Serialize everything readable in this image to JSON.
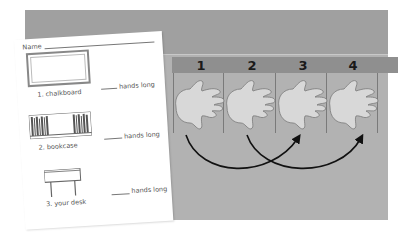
{
  "board": {
    "background_color": "#a3a3a3",
    "strip_header_color": "#8f8f8f",
    "numbers": [
      "1",
      "2",
      "3",
      "4"
    ]
  },
  "worksheet": {
    "name_label": "Name",
    "items": [
      {
        "label": "1. chalkboard",
        "answer_suffix": "hands long",
        "icon": "chalkboard-icon"
      },
      {
        "label": "2. bookcase",
        "answer_suffix": "hands long",
        "icon": "bookcase-icon"
      },
      {
        "label": "3. your desk",
        "answer_suffix": "hands long",
        "icon": "desk-icon"
      }
    ]
  },
  "arrows": [
    {
      "from": "1",
      "to": "3"
    },
    {
      "from": "2",
      "to": "4"
    }
  ]
}
